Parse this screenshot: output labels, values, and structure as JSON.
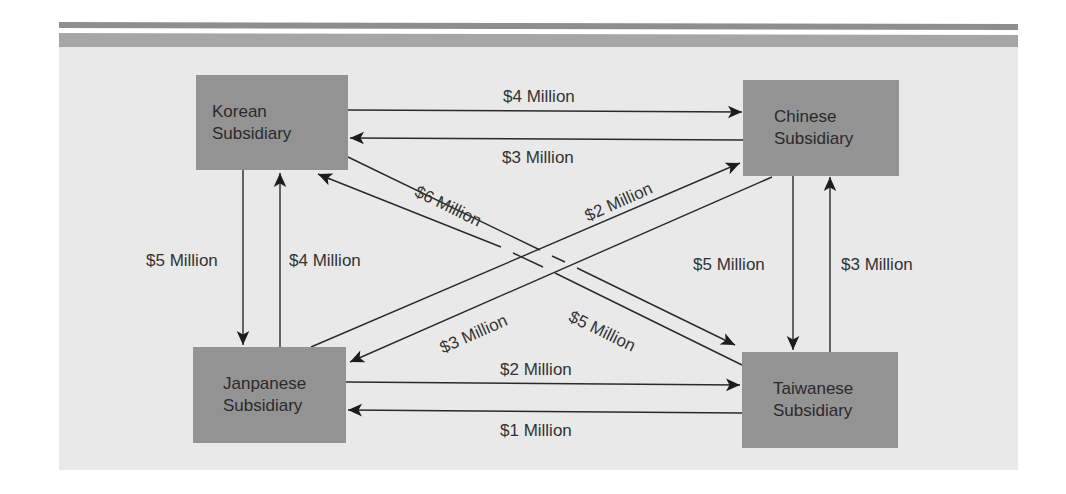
{
  "diagram": {
    "colors": {
      "background": "#ffffff",
      "panel": "#e9e9e9",
      "band_dark": "#8e8e8e",
      "band_light": "#a6a6a6",
      "box": "#939393",
      "arrow": "#2a2a2a",
      "text": "#333333"
    },
    "nodes": {
      "korean": {
        "line1": "Korean",
        "line2": "Subsidiary"
      },
      "chinese": {
        "line1": "Chinese",
        "line2": "Subsidiary"
      },
      "japanese": {
        "line1": "Janpanese",
        "line2": "Subsidiary"
      },
      "taiwanese": {
        "line1": "Taiwanese",
        "line2": "Subsidiary"
      }
    },
    "flows": {
      "korean_to_chinese": {
        "from": "Korean Subsidiary",
        "to": "Chinese Subsidiary",
        "label": "$4 Million"
      },
      "chinese_to_korean": {
        "from": "Chinese Subsidiary",
        "to": "Korean Subsidiary",
        "label": "$3 Million"
      },
      "korean_to_japanese": {
        "from": "Korean Subsidiary",
        "to": "Janpanese Subsidiary",
        "label": "$5 Million"
      },
      "japanese_to_korean": {
        "from": "Janpanese Subsidiary",
        "to": "Korean Subsidiary",
        "label": "$4 Million"
      },
      "chinese_to_taiwanese": {
        "from": "Chinese Subsidiary",
        "to": "Taiwanese Subsidiary",
        "label": "$5 Million"
      },
      "taiwanese_to_chinese": {
        "from": "Taiwanese Subsidiary",
        "to": "Chinese Subsidiary",
        "label": "$3 Million"
      },
      "japanese_to_taiwanese": {
        "from": "Janpanese Subsidiary",
        "to": "Taiwanese Subsidiary",
        "label": "$2 Million"
      },
      "taiwanese_to_japanese": {
        "from": "Taiwanese Subsidiary",
        "to": "Janpanese Subsidiary",
        "label": "$1 Million"
      },
      "taiwanese_to_korean": {
        "from": "Taiwanese Subsidiary",
        "to": "Korean Subsidiary",
        "label": "$6 Million"
      },
      "korean_to_taiwanese": {
        "from": "Korean Subsidiary",
        "to": "Taiwanese Subsidiary",
        "label": "$5 Million"
      },
      "japanese_to_chinese": {
        "from": "Janpanese Subsidiary",
        "to": "Chinese Subsidiary",
        "label": "$2 Million"
      },
      "chinese_to_japanese": {
        "from": "Chinese Subsidiary",
        "to": "Janpanese Subsidiary",
        "label": "$3 Million"
      }
    }
  }
}
